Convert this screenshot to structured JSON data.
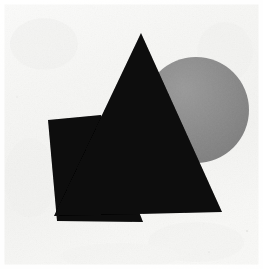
{
  "artwork": {
    "title": "Abstract Suprematist Composition",
    "medium_appearance": "paper-scan",
    "canvas": {
      "width": 263,
      "height": 269
    },
    "palette": {
      "background": "#f7f7f5",
      "paper_edge": "#ffffff",
      "shape_black": "#080808",
      "shape_gray": "#8b8b8b",
      "gray_shade_light": "#9a9a9a",
      "gray_shade_dark": "#7e7e7e",
      "texture_speck": "#d8d8d6"
    },
    "shapes": [
      {
        "id": "gray-circle",
        "name": "circle",
        "fill": "#8b8b8b",
        "cx": 196,
        "cy": 110,
        "r": 53
      },
      {
        "id": "black-quadrilateral",
        "name": "quadrilateral",
        "fill": "#080808",
        "points": "48,120 101,115 143,222 57,221"
      },
      {
        "id": "black-triangle",
        "name": "triangle",
        "fill": "#080808",
        "points": "141,33 222,212 54,216"
      }
    ],
    "background_field": {
      "id": "paper-field",
      "name": "paper-background",
      "fill": "#f7f7f5",
      "x": 0,
      "y": 0,
      "width": 263,
      "height": 269
    }
  }
}
